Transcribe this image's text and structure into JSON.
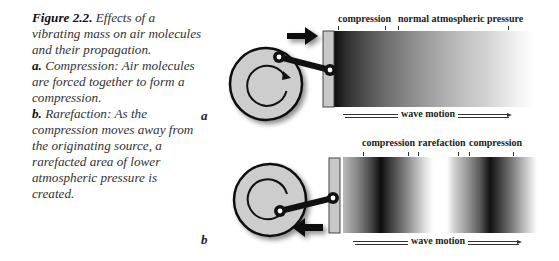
{
  "caption": {
    "figure_label": "Figure 2.2.",
    "figure_title": "Effects of a vibrating mass on air molecules and their propagation.",
    "part_a_label": "a.",
    "part_a_text": "Compression: Air molecules are forced together to form a compression.",
    "part_b_label": "b.",
    "part_b_text": "Rarefaction: As the compression moves away from the originating source, a rarefacted area of lower atmospheric pressure is created."
  },
  "panel_a": {
    "letter": "a",
    "labels": [
      "compression",
      "normal atmospheric pressure"
    ],
    "wave_motion": "wave motion",
    "arrow_direction": "right",
    "colors": {
      "disk": "#cfcfcf",
      "plate": "#c8c8c8",
      "dark": "#111111",
      "light": "#f4f4f4"
    }
  },
  "panel_b": {
    "letter": "b",
    "labels": [
      "compression",
      "rarefaction",
      "compression"
    ],
    "wave_motion": "wave motion",
    "arrow_direction": "left"
  }
}
